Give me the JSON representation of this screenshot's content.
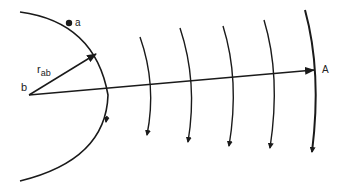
{
  "diagram": {
    "labels": {
      "point_a": "a",
      "point_b": "b",
      "vector_r": "r",
      "vector_r_sub": "ab",
      "point_A": "A"
    },
    "colors": {
      "stroke": "#1a1a1a",
      "background": "#ffffff"
    },
    "wavefronts_count": 5
  }
}
